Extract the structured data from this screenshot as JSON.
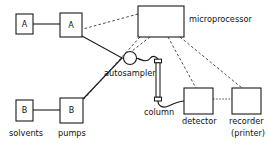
{
  "diagram": {
    "colors": {
      "stroke": "#1a1a1a",
      "dashed_stroke": "#2b2b2b",
      "fill": "#ffffff",
      "text": "#111111"
    },
    "nodes": {
      "solvent_a": {
        "label": "A",
        "caption": "",
        "x": 16,
        "y": 14,
        "w": 17,
        "h": 20
      },
      "solvent_b": {
        "label": "B",
        "caption": "",
        "x": 16,
        "y": 100,
        "w": 17,
        "h": 21
      },
      "pump_a": {
        "label": "A",
        "caption": "",
        "x": 60,
        "y": 13,
        "w": 22,
        "h": 24
      },
      "pump_b": {
        "label": "B",
        "caption": "",
        "x": 60,
        "y": 98,
        "w": 23,
        "h": 25
      },
      "autosampler": {
        "label": "",
        "caption": "autosampler",
        "cx": 130,
        "cy": 58,
        "r": 6.5
      },
      "column": {
        "label": "",
        "caption": "column",
        "x": 155,
        "y": 60,
        "w": 6,
        "h": 41
      },
      "microprocessor": {
        "label": "",
        "caption": "microprocessor",
        "x": 138,
        "y": 6,
        "w": 46,
        "h": 31
      },
      "detector": {
        "label": "",
        "caption": "detector",
        "x": 184,
        "y": 88,
        "w": 29,
        "h": 26
      },
      "recorder": {
        "label": "",
        "caption": "recorder",
        "caption2": "(printer)",
        "x": 232,
        "y": 88,
        "w": 29,
        "h": 26
      }
    },
    "captions": {
      "solvents": "solvents",
      "pumps": "pumps",
      "autosampler": "autosampler",
      "column": "column",
      "detector": "detector",
      "microprocessor": "microprocessor",
      "recorder": "recorder",
      "recorder_sub": "(printer)"
    },
    "links": {
      "flow": [
        {
          "from": "solvent_a",
          "to": "pump_a",
          "style": "solid"
        },
        {
          "from": "solvent_b",
          "to": "pump_b",
          "style": "solid"
        },
        {
          "from": "pump_a",
          "to": "autosampler",
          "style": "solid"
        },
        {
          "from": "pump_b",
          "to": "autosampler",
          "style": "solid"
        },
        {
          "from": "autosampler",
          "to": "column",
          "style": "tube"
        },
        {
          "from": "column",
          "to": "detector",
          "style": "tube"
        }
      ],
      "control": [
        {
          "from": "microprocessor",
          "to": "pump_a",
          "style": "dashed"
        },
        {
          "from": "microprocessor",
          "to": "pump_b",
          "style": "dashed"
        },
        {
          "from": "microprocessor",
          "to": "autosampler",
          "style": "dashed"
        },
        {
          "from": "microprocessor",
          "to": "detector",
          "style": "dashed"
        },
        {
          "from": "microprocessor",
          "to": "recorder",
          "style": "dashed"
        },
        {
          "from": "detector",
          "to": "recorder",
          "style": "dotted"
        }
      ]
    }
  }
}
